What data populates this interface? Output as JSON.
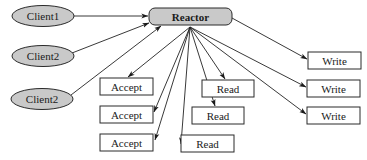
{
  "diagram": {
    "colors": {
      "node_fill_gray": "#c9c9c9",
      "box_fill": "#ffffff",
      "stroke": "#2a2a2a",
      "background": "#ffffff"
    },
    "clients": [
      {
        "id": "client1",
        "label": "Client1",
        "cx": 43,
        "cy": 16,
        "rx": 31,
        "ry": 10.5
      },
      {
        "id": "client2a",
        "label": "Client2",
        "cx": 43,
        "cy": 56,
        "rx": 31,
        "ry": 10.5
      },
      {
        "id": "client2b",
        "label": "Client2",
        "cx": 42,
        "cy": 99,
        "rx": 31,
        "ry": 10.5
      }
    ],
    "reactor": {
      "id": "reactor",
      "label": "Reactor",
      "x": 149,
      "y": 8,
      "w": 83,
      "h": 17
    },
    "accepts": [
      {
        "id": "accept1",
        "label": "Accept",
        "x": 100,
        "y": 78,
        "w": 53,
        "h": 17
      },
      {
        "id": "accept2",
        "label": "Accept",
        "x": 100,
        "y": 106,
        "w": 53,
        "h": 17
      },
      {
        "id": "accept3",
        "label": "Accept",
        "x": 100,
        "y": 134,
        "w": 53,
        "h": 17
      }
    ],
    "reads": [
      {
        "id": "read1",
        "label": "Read",
        "x": 202,
        "y": 80,
        "w": 52,
        "h": 17
      },
      {
        "id": "read2",
        "label": "Read",
        "x": 192,
        "y": 107,
        "w": 52,
        "h": 17
      },
      {
        "id": "read3",
        "label": "Read",
        "x": 181,
        "y": 135,
        "w": 53,
        "h": 17
      }
    ],
    "writes": [
      {
        "id": "write1",
        "label": "Write",
        "x": 308,
        "y": 52,
        "w": 53,
        "h": 17
      },
      {
        "id": "write2",
        "label": "Write",
        "x": 307,
        "y": 80,
        "w": 53,
        "h": 17
      },
      {
        "id": "write3",
        "label": "Write",
        "x": 307,
        "y": 107,
        "w": 53,
        "h": 17
      }
    ],
    "edges": [
      {
        "from": "client1",
        "to": "reactor"
      },
      {
        "from": "client2a",
        "to": "reactor"
      },
      {
        "from": "client2b",
        "to": "reactor"
      },
      {
        "from": "reactor",
        "to": "accept1"
      },
      {
        "from": "reactor",
        "to": "accept2"
      },
      {
        "from": "reactor",
        "to": "accept3"
      },
      {
        "from": "reactor",
        "to": "read1"
      },
      {
        "from": "reactor",
        "to": "read2"
      },
      {
        "from": "reactor",
        "to": "read3"
      },
      {
        "from": "reactor",
        "to": "write1"
      },
      {
        "from": "reactor",
        "to": "write2"
      },
      {
        "from": "reactor",
        "to": "write3"
      }
    ]
  }
}
